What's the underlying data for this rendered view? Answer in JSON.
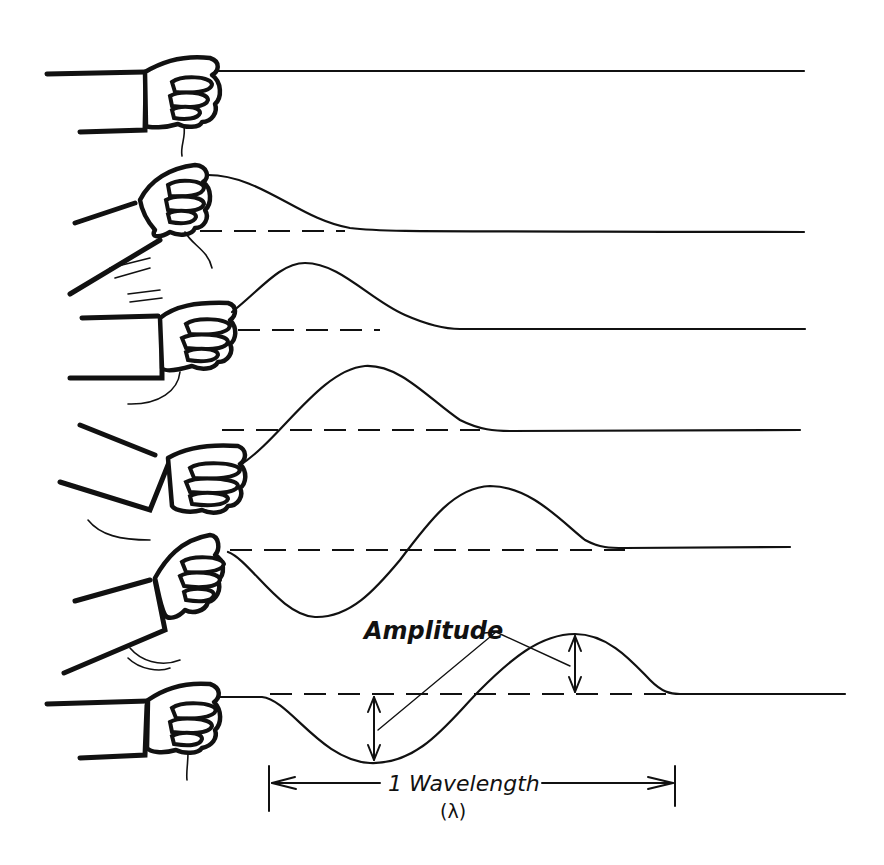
{
  "diagram": {
    "rows": [
      {
        "id": 1,
        "description": "Rope at rest, hand holding straight",
        "baseline_y": 71
      },
      {
        "id": 2,
        "description": "Hand moves up, pulse begins",
        "baseline_y": 231
      },
      {
        "id": 3,
        "description": "Crest travels along rope",
        "baseline_y": 329
      },
      {
        "id": 4,
        "description": "Crest moves further, hand at bottom",
        "baseline_y": 430
      },
      {
        "id": 5,
        "description": "Trough forms behind crest",
        "baseline_y": 548
      },
      {
        "id": 6,
        "description": "Full wavelength with amplitude marked",
        "baseline_y": 694
      }
    ],
    "labels": {
      "amplitude": "Amplitude",
      "wavelength": "1 Wavelength",
      "wavelength_symbol": "(λ)"
    },
    "colors": {
      "ink": "#111111",
      "background": "#ffffff"
    }
  }
}
